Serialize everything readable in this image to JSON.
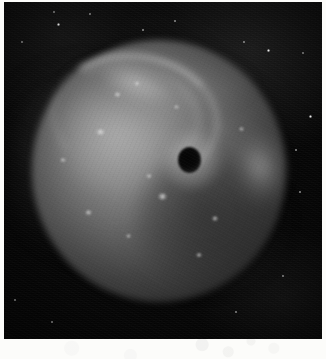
{
  "media": {
    "kind": "scanned-photographic-plate",
    "subject_label": "nebula",
    "palette": "grayscale",
    "paper_color": "#fcfcfa",
    "plate_background_color": "#070707",
    "plate_rect": {
      "x": 4,
      "y": 2,
      "width": 318,
      "height": 337
    }
  },
  "features": {
    "nebula": {
      "label": "nebula-disc",
      "center_x": 155,
      "center_y": 169,
      "radius_x": 127,
      "radius_y": 131,
      "bright_side": "upper-left",
      "dark_side": "lower-right"
    },
    "dark_spot": {
      "label": "dark-central-spot",
      "center_x": 185,
      "center_y": 158,
      "radius": 12,
      "color": "#070707"
    },
    "bright_arc": {
      "label": "bright-arc",
      "description": "curved bright filament sweeping from upper-left toward the dark spot",
      "color": "#d6d6d6"
    },
    "tail": {
      "label": "diffuse-tail",
      "description": "diffuse glow extending off the left edge of the plate",
      "direction": "left"
    },
    "rim_patch": {
      "label": "bright-rim-patch",
      "center_x": 261,
      "center_y": 169,
      "color": "#b2b2b2"
    }
  },
  "knots": [
    {
      "x": 162,
      "y": 196,
      "w": 9,
      "h": 7
    },
    {
      "x": 117,
      "y": 94,
      "w": 7,
      "h": 5
    },
    {
      "x": 137,
      "y": 83,
      "w": 6,
      "h": 5
    },
    {
      "x": 100,
      "y": 132,
      "w": 11,
      "h": 6
    },
    {
      "x": 149,
      "y": 176,
      "w": 6,
      "h": 4
    },
    {
      "x": 176,
      "y": 107,
      "w": 5,
      "h": 4
    },
    {
      "x": 215,
      "y": 218,
      "w": 6,
      "h": 5
    },
    {
      "x": 88,
      "y": 212,
      "w": 7,
      "h": 5
    },
    {
      "x": 128,
      "y": 236,
      "w": 5,
      "h": 4
    },
    {
      "x": 199,
      "y": 255,
      "w": 6,
      "h": 4
    },
    {
      "x": 241,
      "y": 129,
      "w": 5,
      "h": 4
    },
    {
      "x": 63,
      "y": 160,
      "w": 6,
      "h": 4
    }
  ],
  "stars": [
    {
      "x": 58,
      "y": 24,
      "size": 3
    },
    {
      "x": 90,
      "y": 14,
      "size": 2
    },
    {
      "x": 54,
      "y": 12,
      "size": 2
    },
    {
      "x": 244,
      "y": 42,
      "size": 2
    },
    {
      "x": 268,
      "y": 50,
      "size": 3
    },
    {
      "x": 303,
      "y": 53,
      "size": 2
    },
    {
      "x": 310,
      "y": 116,
      "size": 3
    },
    {
      "x": 296,
      "y": 150,
      "size": 2
    },
    {
      "x": 300,
      "y": 192,
      "size": 2
    },
    {
      "x": 283,
      "y": 276,
      "size": 2
    },
    {
      "x": 236,
      "y": 312,
      "size": 2
    },
    {
      "x": 143,
      "y": 30,
      "size": 2
    },
    {
      "x": 175,
      "y": 21,
      "size": 2
    },
    {
      "x": 22,
      "y": 42,
      "size": 2
    },
    {
      "x": 15,
      "y": 300,
      "size": 2
    },
    {
      "x": 52,
      "y": 322,
      "size": 2
    }
  ]
}
